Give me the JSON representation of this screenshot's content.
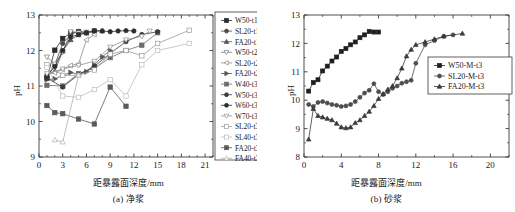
{
  "figure": {
    "panel_a_caption": "(a) 净浆",
    "panel_b_caption": "(b) 砂浆",
    "xlabel": "距暴露面深度/mm",
    "ylabel": "pH"
  },
  "chart_data": [
    {
      "type": "line",
      "panel": "a",
      "title": "(a) 净浆",
      "xlabel": "距暴露面深度/mm",
      "ylabel": "pH",
      "xlim": [
        0,
        22
      ],
      "ylim": [
        9,
        13
      ],
      "xticks": [
        0,
        3,
        6,
        9,
        12,
        15,
        18,
        21
      ],
      "yticks": [
        9,
        10,
        11,
        12,
        13
      ],
      "grid": false,
      "legend_position": "right-outside",
      "series": [
        {
          "name": "W50-t1",
          "marker": "square",
          "filled": true,
          "color": "#2b2b2b",
          "x": [
            1,
            2,
            3,
            4,
            5,
            6,
            7
          ],
          "y": [
            11.22,
            12.01,
            12.34,
            12.49,
            12.53,
            12.5,
            12.55
          ]
        },
        {
          "name": "SL20-t1",
          "marker": "circle",
          "filled": true,
          "color": "#4a4a4a",
          "x": [
            1,
            2,
            3,
            4,
            5,
            6
          ],
          "y": [
            11.25,
            11.6,
            12.2,
            12.45,
            12.54,
            12.5
          ]
        },
        {
          "name": "FA20-t1",
          "marker": "triangle-up",
          "filled": true,
          "color": "#555555",
          "x": [
            1,
            2,
            3,
            4,
            5,
            6,
            7,
            8
          ],
          "y": [
            11.3,
            11.42,
            11.98,
            12.3,
            12.44,
            12.5,
            12.56,
            12.55
          ]
        },
        {
          "name": "W50-t2",
          "marker": "triangle-down",
          "filled": false,
          "color": "#7a7a7a",
          "x": [
            1,
            2,
            3,
            4,
            5,
            6
          ],
          "y": [
            11.82,
            11.62,
            11.95,
            12.53,
            12.5,
            12.52
          ]
        },
        {
          "name": "SL20-t2",
          "marker": "left-triangle",
          "filled": false,
          "color": "#8a8a8a",
          "x": [
            1,
            2,
            3,
            4,
            5,
            6,
            7
          ],
          "y": [
            11.33,
            11.37,
            11.47,
            11.58,
            11.62,
            12.3,
            12.45
          ]
        },
        {
          "name": "FA20-t2",
          "marker": "right-triangle",
          "filled": true,
          "color": "#555555",
          "x": [
            1,
            2,
            3,
            4,
            5,
            6,
            7,
            8,
            9
          ],
          "y": [
            11.18,
            11.2,
            11.3,
            11.38,
            11.33,
            11.4,
            11.6,
            11.82,
            12.0
          ]
        },
        {
          "name": "W40-t3",
          "marker": "square",
          "filled": true,
          "color": "#6d6d6d",
          "x": [
            1,
            3,
            5,
            7,
            9,
            11,
            13,
            15
          ],
          "y": [
            11.02,
            11.0,
            11.35,
            11.5,
            11.8,
            12.0,
            12.15,
            12.5
          ]
        },
        {
          "name": "W50-t3",
          "marker": "circle",
          "filled": true,
          "color": "#3a3a3a",
          "x": [
            1,
            3,
            5,
            7,
            9,
            11,
            13,
            15
          ],
          "y": [
            11.22,
            10.97,
            11.32,
            11.55,
            11.92,
            12.25,
            12.45,
            12.53
          ]
        },
        {
          "name": "W60-t3",
          "marker": "circle",
          "filled": true,
          "color": "#2e2e2e",
          "x": [
            1,
            2,
            3,
            4,
            5,
            6,
            7,
            8,
            9,
            10,
            11,
            12
          ],
          "y": [
            11.28,
            11.55,
            12.0,
            12.38,
            12.45,
            12.5,
            12.55,
            12.55,
            12.53,
            12.55,
            12.56,
            12.55
          ]
        },
        {
          "name": "W70-t3",
          "marker": "triangle-down",
          "filled": false,
          "color": "#8f8f8f",
          "x": [
            1,
            3,
            5,
            7,
            9,
            11,
            13,
            14
          ],
          "y": [
            11.35,
            11.48,
            11.58,
            11.7,
            12.1,
            12.3,
            12.4,
            12.55
          ]
        },
        {
          "name": "SL20-t3",
          "marker": "square",
          "filled": false,
          "color": "#9a9a9a",
          "x": [
            1,
            3,
            5,
            7,
            9,
            11,
            13,
            15,
            19
          ],
          "y": [
            11.6,
            11.3,
            11.3,
            11.45,
            11.9,
            12.0,
            11.85,
            12.2,
            12.57
          ]
        },
        {
          "name": "SL40-t3",
          "marker": "square",
          "filled": false,
          "color": "#bdbdbd",
          "x": [
            1,
            3,
            5,
            7,
            9,
            11,
            13,
            15,
            19
          ],
          "y": [
            11.52,
            10.72,
            10.68,
            10.9,
            11.18,
            10.72,
            11.6,
            12.0,
            12.2
          ]
        },
        {
          "name": "FA20-t3",
          "marker": "square",
          "filled": true,
          "color": "#5a5a5a",
          "x": [
            1,
            2,
            3,
            5,
            7,
            9,
            11
          ],
          "y": [
            10.45,
            10.25,
            10.22,
            10.07,
            9.93,
            10.97,
            10.43
          ]
        },
        {
          "name": "FA40-t3",
          "marker": "triangle-up",
          "filled": false,
          "color": "#b0b0b0",
          "x": [
            2,
            3,
            5
          ],
          "y": [
            9.48,
            9.42,
            11.3
          ]
        }
      ]
    },
    {
      "type": "line",
      "panel": "b",
      "title": "(b) 砂浆",
      "xlabel": "距暴露面深度/mm",
      "ylabel": "pH",
      "xlim": [
        0,
        22
      ],
      "ylim": [
        8,
        13
      ],
      "xticks": [
        0,
        4,
        8,
        12,
        16,
        20
      ],
      "yticks": [
        8,
        9,
        10,
        11,
        12,
        13
      ],
      "grid": false,
      "legend_position": "inside-right",
      "series": [
        {
          "name": "W50-M-t3",
          "marker": "square",
          "filled": true,
          "color": "#1f1f1f",
          "x": [
            0.5,
            1.0,
            1.5,
            2.0,
            2.5,
            3.0,
            3.5,
            4.0,
            4.5,
            5.0,
            5.5,
            6.0,
            6.5,
            7.0,
            7.5,
            8.0
          ],
          "y": [
            10.32,
            10.62,
            10.72,
            11.03,
            11.2,
            11.38,
            11.52,
            11.72,
            11.82,
            11.95,
            12.05,
            12.2,
            12.3,
            12.42,
            12.4,
            12.4
          ]
        },
        {
          "name": "SL20-M-t3",
          "marker": "circle",
          "filled": true,
          "color": "#4d4d4d",
          "x": [
            0.5,
            1.0,
            1.5,
            2.0,
            2.5,
            3.0,
            3.5,
            4.0,
            4.5,
            5.0,
            5.5,
            6.0,
            6.5,
            7.0,
            7.5,
            8.0,
            8.5,
            9.0,
            9.5,
            10.0,
            10.5,
            11.0,
            11.5,
            12.0,
            13.0,
            14.0,
            15.0,
            16.0
          ],
          "y": [
            9.85,
            9.78,
            9.92,
            9.95,
            9.9,
            9.85,
            9.82,
            9.78,
            9.8,
            9.85,
            9.95,
            10.1,
            10.25,
            10.35,
            10.58,
            10.3,
            10.2,
            10.3,
            10.42,
            10.5,
            10.6,
            10.65,
            10.7,
            11.3,
            11.95,
            12.1,
            12.25,
            12.3
          ]
        },
        {
          "name": "FA20-M-t3",
          "marker": "triangle-up",
          "filled": true,
          "color": "#3a3a3a",
          "x": [
            0.5,
            1.0,
            1.5,
            2.0,
            2.5,
            3.0,
            3.5,
            4.0,
            4.5,
            5.0,
            5.5,
            6.0,
            6.5,
            7.0,
            7.5,
            8.0,
            8.5,
            9.0,
            9.5,
            10.0,
            10.5,
            11.0,
            11.5,
            12.0,
            13.0,
            14.0,
            15.0,
            17.0
          ],
          "y": [
            8.62,
            9.7,
            9.45,
            9.4,
            9.35,
            9.3,
            9.18,
            9.05,
            9.02,
            9.05,
            9.2,
            9.3,
            9.45,
            9.6,
            9.8,
            10.05,
            10.22,
            10.38,
            10.5,
            10.78,
            11.12,
            11.55,
            11.78,
            11.95,
            12.05,
            12.15,
            12.25,
            12.35
          ]
        }
      ]
    }
  ]
}
